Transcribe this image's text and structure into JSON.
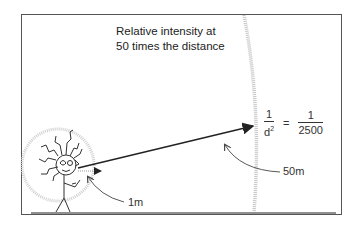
{
  "diagram": {
    "title_line1": "Relative intensity at",
    "title_line2": "50 times the distance",
    "formula": {
      "lhs_numerator": "1",
      "lhs_denominator": "d",
      "lhs_exponent": "2",
      "equals": "=",
      "rhs_numerator": "1",
      "rhs_denominator": "2500"
    },
    "labels": {
      "near_distance": "1m",
      "far_distance": "50m"
    },
    "colors": {
      "line": "#222222",
      "arc": "#bdbdbd",
      "frame": "#555555"
    }
  }
}
